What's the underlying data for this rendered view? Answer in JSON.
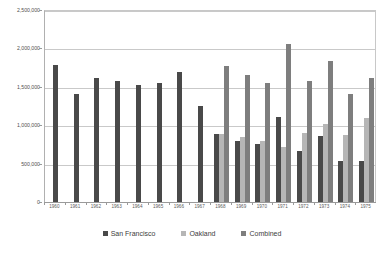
{
  "chart_data": {
    "type": "bar",
    "title": "",
    "xlabel": "",
    "ylabel": "",
    "ylim": [
      0,
      2500000
    ],
    "grid": true,
    "legend_position": "bottom",
    "categories": [
      "1960",
      "1961",
      "1962",
      "1963",
      "1964",
      "1965",
      "1966",
      "1967",
      "1968",
      "1969",
      "1970",
      "1971",
      "1972",
      "1973",
      "1974",
      "1975"
    ],
    "yticks": [
      "0",
      "500,000",
      "1,000,000",
      "1,500,000",
      "2,000,000",
      "2,500,000"
    ],
    "ytick_values": [
      0,
      500000,
      1000000,
      1500000,
      2000000,
      2500000
    ],
    "series": [
      {
        "name": "San Francisco",
        "color": "#494949",
        "values": [
          1790000,
          1400000,
          1610000,
          1580000,
          1520000,
          1550000,
          1690000,
          1255000,
          880000,
          800000,
          760000,
          1110000,
          660000,
          860000,
          530000,
          540000
        ]
      },
      {
        "name": "Oakland",
        "color": "#b6b6b6",
        "values": [
          null,
          null,
          null,
          null,
          null,
          null,
          null,
          null,
          880000,
          850000,
          790000,
          720000,
          900000,
          1020000,
          870000,
          1090000
        ]
      },
      {
        "name": "Combined",
        "color": "#7e7e7e",
        "values": [
          null,
          null,
          null,
          null,
          null,
          null,
          null,
          null,
          1770000,
          1660000,
          1550000,
          2060000,
          1570000,
          1830000,
          1400000,
          1610000
        ]
      }
    ]
  },
  "legend": {
    "items": [
      {
        "label": "San Francisco",
        "color": "#494949"
      },
      {
        "label": "Oakland",
        "color": "#b6b6b6"
      },
      {
        "label": "Combined",
        "color": "#7e7e7e"
      }
    ]
  }
}
